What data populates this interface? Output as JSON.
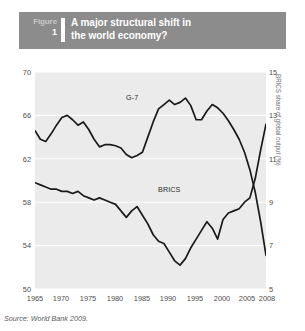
{
  "figure": {
    "tag_word": "Figure",
    "tag_number": "1",
    "title_line1": "A major structural shift in",
    "title_line2": "the world economy?",
    "header_bg": "#8c8c8c",
    "plot_bg": "#ebebeb",
    "line_color": "#1a1a1a"
  },
  "source": "Source: World Bank 2009.",
  "labels": {
    "g7": "G-7",
    "brics": "BRICS"
  },
  "chart_data": {
    "type": "line",
    "title": "A major structural shift in the world economy?",
    "xlabel": "",
    "ylabel": "G-7 share of global output (%)",
    "y2label": "BRICS share of global output (%)",
    "xlim": [
      1965,
      2008
    ],
    "ylim": [
      50,
      70
    ],
    "y2lim": [
      5,
      15
    ],
    "yticks": [
      70,
      66,
      62,
      58,
      54,
      50
    ],
    "y2ticks": [
      15,
      13,
      11,
      9,
      7,
      5
    ],
    "xticks": [
      1965,
      1970,
      1975,
      1980,
      1985,
      1990,
      1995,
      2000,
      2005,
      2008
    ],
    "grid": "horizontal-white",
    "legend": "inline-annotations",
    "x": [
      1965,
      1966,
      1967,
      1968,
      1969,
      1970,
      1971,
      1972,
      1973,
      1974,
      1975,
      1976,
      1977,
      1978,
      1979,
      1980,
      1981,
      1982,
      1983,
      1984,
      1985,
      1986,
      1987,
      1988,
      1989,
      1990,
      1991,
      1992,
      1993,
      1994,
      1995,
      1996,
      1997,
      1998,
      1999,
      2000,
      2001,
      2002,
      2003,
      2004,
      2005,
      2006,
      2007,
      2008
    ],
    "series": [
      {
        "name": "G-7",
        "axis": "left",
        "units": "% of global output",
        "values": [
          64.6,
          63.8,
          63.6,
          64.3,
          65.1,
          65.8,
          66.0,
          65.6,
          65.1,
          65.4,
          64.7,
          63.8,
          63.1,
          63.3,
          63.3,
          63.2,
          63.0,
          62.4,
          62.1,
          62.3,
          62.6,
          64.0,
          65.4,
          66.6,
          67.0,
          67.4,
          67.0,
          67.2,
          67.6,
          66.9,
          65.6,
          65.6,
          66.4,
          67.0,
          66.7,
          66.2,
          65.5,
          64.7,
          63.8,
          62.6,
          61.0,
          58.9,
          56.2,
          53.1
        ]
      },
      {
        "name": "BRICS",
        "axis": "right",
        "units": "% of global output",
        "values": [
          9.9,
          9.8,
          9.7,
          9.6,
          9.6,
          9.5,
          9.5,
          9.4,
          9.5,
          9.3,
          9.2,
          9.1,
          9.2,
          9.1,
          9.0,
          8.9,
          8.6,
          8.3,
          8.6,
          8.8,
          8.4,
          8.0,
          7.5,
          7.2,
          7.1,
          6.7,
          6.3,
          6.1,
          6.4,
          6.9,
          7.3,
          7.7,
          8.1,
          7.8,
          7.3,
          8.2,
          8.5,
          8.6,
          8.7,
          9.0,
          9.2,
          10.1,
          11.4,
          12.6
        ]
      }
    ],
    "annotations": [
      {
        "text": "G-7",
        "x": 1979,
        "y": 66.6
      },
      {
        "text": "BRICS",
        "x": 1992,
        "y": 8.0
      }
    ]
  }
}
